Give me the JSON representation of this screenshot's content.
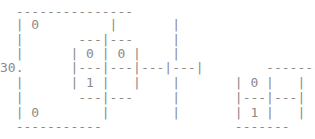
{
  "document": {
    "kind": "ascii-art-grid-diagram",
    "label": "30.",
    "foreground_color": "#8a8a8a",
    "background_color": "#ffffff",
    "char_width_px": 7.8,
    "line_height_px": 15,
    "columns": 40,
    "rows": 9
  },
  "ascii": {
    "rows": [
      "  - - - - - - - - - - - - - - -",
      "  |  0          |       |",
      "  |        ---|---      |",
      "  |       | 0 | 0 |     |",
      "30.       |---|---|---|---|",
      "  |       | 1 |   |     |        |  0  |     |",
      "  |        ---|---      |       |---|---|",
      "  |            |        |       |  1  |     |",
      "  - - - - - - - - - -           - - - - -"
    ],
    "row_1": "  ---------------",
    "row_2": "  | 0         |       |",
    "row_3": "  |       ---|---     |",
    "row_4": "  |      | 0 | 0 |    |",
    "row_5": "30.      |---|---|---|---|        -------",
    "row_6": "  |      | 1 |   |    |       | 0 |   |",
    "row_7": "  |       ---|---     |       |---|---|",
    "row_8": "  | 0        |        |       | 1 |   |",
    "row_9": "  -----------                 -------"
  },
  "cells": {
    "left_grid_values": [
      "0",
      "0",
      "1"
    ],
    "right_grid_values": [
      "0",
      "1"
    ],
    "outer_left_values": [
      "0",
      "0"
    ]
  },
  "labels": {
    "row_label": "30."
  }
}
